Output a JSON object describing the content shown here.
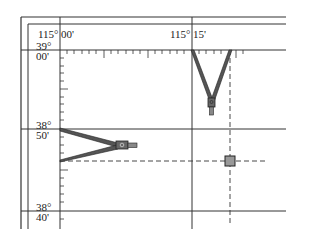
{
  "figure": {
    "type": "map-graticule-with-dividers",
    "colors": {
      "line": "#333333",
      "divider_fill": "#555555",
      "marker_fill": "#999999",
      "background": "#ffffff"
    },
    "longitude_labels": [
      {
        "deg": "115°",
        "min": "00'"
      },
      {
        "deg": "115°",
        "min": "15'"
      }
    ],
    "latitude_labels": [
      {
        "deg": "39°",
        "min": "00'"
      },
      {
        "deg": "38°",
        "min": "50'"
      },
      {
        "deg": "38°",
        "min": "40'"
      }
    ],
    "dividers": [
      {
        "id": "top-divider",
        "orientation": "vertical",
        "span": "115°15' to tick position"
      },
      {
        "id": "left-divider",
        "orientation": "horizontal",
        "span": "38°50' to tick position"
      }
    ],
    "marker": {
      "shape": "square",
      "description": "plotted point at intersection of dashed lines"
    }
  }
}
